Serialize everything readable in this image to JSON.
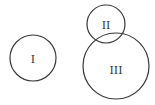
{
  "diagram": {
    "type": "circle-diagram",
    "stroke_color": "#3a3a3a",
    "background": "#ffffff",
    "circles": [
      {
        "label": "I",
        "cx": 33,
        "cy": 58,
        "r": 23
      },
      {
        "label": "II",
        "cx": 106,
        "cy": 24,
        "r": 19
      },
      {
        "label": "III",
        "cx": 116,
        "cy": 66,
        "r": 33
      }
    ]
  }
}
